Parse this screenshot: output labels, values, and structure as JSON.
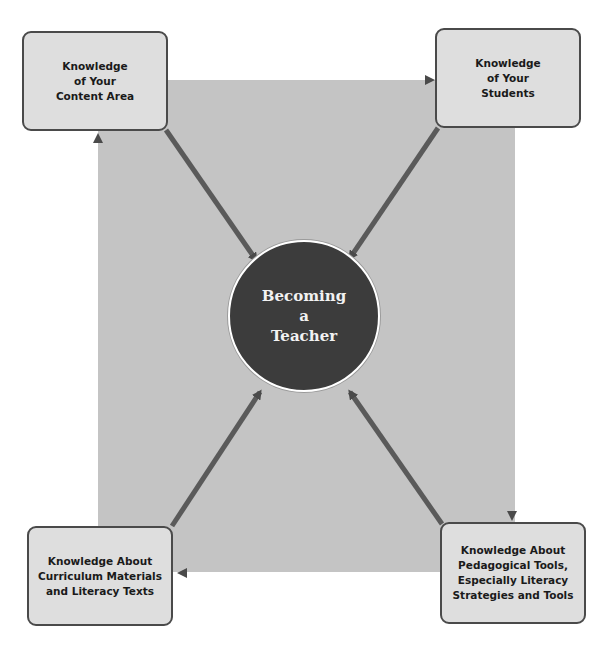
{
  "diagram": {
    "center": {
      "lines": [
        "Becoming",
        "a",
        "Teacher"
      ]
    },
    "nodes": [
      {
        "id": "content-area",
        "lines": [
          "Knowledge",
          "of Your",
          "Content Area"
        ]
      },
      {
        "id": "students",
        "lines": [
          "Knowledge",
          "of Your",
          "Students"
        ]
      },
      {
        "id": "pedagogical-tools",
        "lines": [
          "Knowledge About",
          "Pedagogical Tools,",
          "Especially Literacy",
          "Strategies and Tools"
        ]
      },
      {
        "id": "curriculum-materials",
        "lines": [
          "Knowledge About",
          "Curriculum Materials",
          "and Literacy Texts"
        ]
      }
    ],
    "edges": [
      {
        "from": "content-area",
        "to": "students"
      },
      {
        "from": "students",
        "to": "pedagogical-tools"
      },
      {
        "from": "pedagogical-tools",
        "to": "curriculum-materials"
      },
      {
        "from": "curriculum-materials",
        "to": "content-area"
      },
      {
        "from": "content-area",
        "to": "center"
      },
      {
        "from": "students",
        "to": "center"
      },
      {
        "from": "pedagogical-tools",
        "to": "center"
      },
      {
        "from": "curriculum-materials",
        "to": "center"
      }
    ],
    "colors": {
      "panel": "#c4c4c4",
      "node_fill": "#dedede",
      "node_border": "#4a4a4a",
      "arrow": "#555555",
      "center_fill": "#3c3c3c",
      "center_text": "#f2f2f2"
    }
  }
}
